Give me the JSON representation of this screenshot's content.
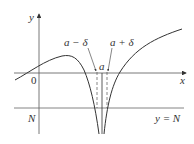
{
  "diagram": {
    "axes": {
      "x_label": "x",
      "y_label": "y",
      "origin_label": "0"
    },
    "labels": {
      "a_minus_delta": "a − δ",
      "a_plus_delta": "a + δ",
      "a": "a",
      "N": "N",
      "line_label": "y = N"
    },
    "colors": {
      "curve": "#333333",
      "axis": "#555555",
      "line": "#666666"
    }
  }
}
